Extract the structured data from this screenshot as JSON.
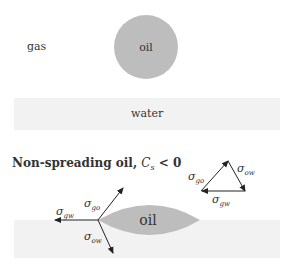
{
  "top_panel": {
    "gas_label": "gas",
    "oil_label": "oil",
    "water_label": "water"
  },
  "bottom_panel": {
    "title_text": "Non-spreading oil, ",
    "title_math": "C",
    "title_math_sub": "s",
    "title_relation": " < 0",
    "oil_label": "oil",
    "labels": {
      "sigma": "σ",
      "go": "go",
      "gw": "gw",
      "ow": "ow"
    }
  },
  "colors": {
    "oil": "#bdbdbd",
    "water": "#f2f2f2",
    "arrow": "#222222"
  }
}
